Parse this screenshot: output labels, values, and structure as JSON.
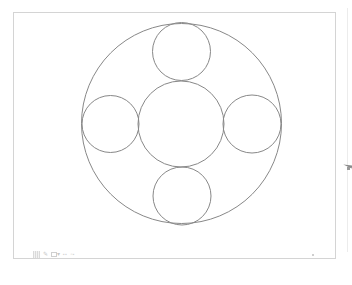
{
  "canvas": {
    "frame": {
      "x": 13,
      "y": 12,
      "width": 323,
      "height": 247,
      "border_color": "#d4d4d4"
    },
    "stroke_color": "#888888",
    "stroke_width": 1,
    "shapes": [
      {
        "name": "outer-circle",
        "cx": 181.5,
        "cy": 123.5,
        "r": 100
      },
      {
        "name": "center-circle",
        "cx": 181,
        "cy": 124,
        "r": 43
      },
      {
        "name": "top-circle",
        "cx": 181.5,
        "cy": 51.5,
        "r": 29
      },
      {
        "name": "left-circle",
        "cx": 110.5,
        "cy": 124,
        "r": 28.5
      },
      {
        "name": "right-circle",
        "cx": 252,
        "cy": 124,
        "r": 29
      },
      {
        "name": "bottom-circle",
        "cx": 182,
        "cy": 196,
        "r": 29
      }
    ]
  },
  "toolbar": {
    "items": [
      {
        "name": "grid-icon",
        "glyph": ""
      },
      {
        "name": "pencil-icon",
        "glyph": "✎"
      },
      {
        "name": "frame-icon",
        "glyph": ""
      },
      {
        "name": "dropdown-icon",
        "glyph": "▾"
      },
      {
        "name": "zoom-label",
        "glyph": ""
      },
      {
        "name": "layout-label",
        "glyph": ""
      }
    ]
  },
  "pointer": {
    "icon": "cursor-arrow-icon",
    "color": "#8a8a8a"
  }
}
